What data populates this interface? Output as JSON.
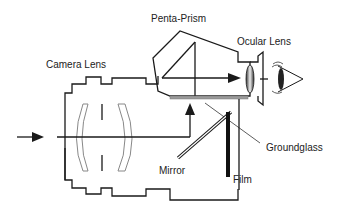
{
  "diagram": {
    "labels": {
      "camera_lens": "Camera Lens",
      "penta_prism": "Penta-Prism",
      "ocular_lens": "Ocular Lens",
      "groundglass": "Groundglass",
      "mirror": "Mirror",
      "film": "Film"
    },
    "colors": {
      "line": "#1a1a1a",
      "lens_element": "#888888",
      "groundglass": "#9a9a9a"
    }
  }
}
